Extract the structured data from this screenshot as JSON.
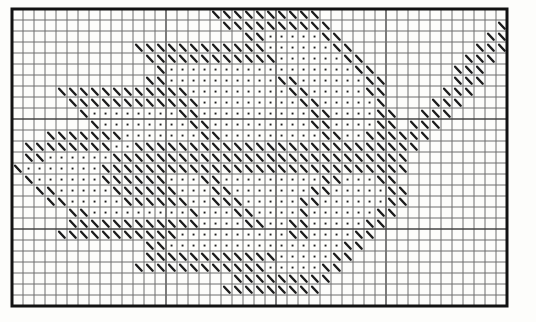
{
  "chart": {
    "type": "stitch-grid",
    "columns": 45,
    "rows": 27,
    "cell_px": 11,
    "origin_x": 12,
    "origin_y": 9,
    "symbols": {
      "S": "backslash-stitch",
      "o": "dot-stitch",
      ".": "empty"
    },
    "bold_columns": [
      14,
      24,
      34
    ],
    "bold_rows": [
      10,
      20
    ],
    "colors": {
      "background": "#fdfdfb",
      "grid_line": "#6e6e6e",
      "bold_grid_line": "#454545",
      "border": "#121212",
      "stitch": "#1c1c1c",
      "dot": "#1c1c1c"
    },
    "pattern_rows": [
      "..................SSSSSSSSSS.................",
      "...................SSSSSSSSSS...............S",
      ".....................SSoooooSS.............SS",
      "...........SSSSSSSSSSSSooooooSS...........SSS",
      "............SSSSSSSSSSSSooooooSS.........SSS.",
      ".............SoooooooooooooooooSS.......SSS..",
      "............SSooooooooooSSooooooSS......SSS..",
      "....SSSSSSSSSSSSoooooooooSSoooooSS.....SSS...",
      ".....SSSSSSSSSSSSoooooooooSSoooooS....SSS....",
      "......SooooooooSSooooooooooSSooooSS..SSS.....",
      ".......SooooooooSSoooooooooSSooooSS.SSS......",
      "...SSSSSSSoooooooSSoooooooooSSooSSSSSS.......",
      ".SSSSSSSSooSSSSSSSSSSSSSSSSSSSSSSSSSS........",
      ".SSooooooSSSSSSSSSSSSSSSSSSSSSSSSSSS.........",
      "SoooooooSSSSSSSSSSSSSSSSSSSSSSSSSSSS.........",
      ".SooooooSSSSSSoooSSoooooooooSSoooSS..........",
      "..SSoooooSSSSSSoooSSoooooooSSoooooSS.........",
      "...SSoooooSSSSSSooSSSoooooSSooooooSS.........",
      ".....SSoooooooooSoooSSooooSooooooSS..........",
      ".....SSSSSSSSSSSSooooSSooSSoooooSS...........",
      "....SSSSSSSSSSSooooooooooSSooooSS............",
      "............SSooooooooooooooooSS.............",
      "............SSSSSSSSSSSSoooooSS..............",
      "...........SSSSSSSSSSSSoooooSS...............",
      "....................SSSSSSSSS................",
      "...................SSSSSSSSS.................",
      "............................................."
    ]
  }
}
